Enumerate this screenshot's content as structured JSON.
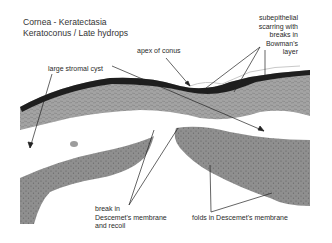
{
  "title": {
    "line1": "Cornea - Keratectasia",
    "line2": "Keratoconus / Late hydrops"
  },
  "labels": {
    "apex": "apex of conus",
    "cyst": "large stromal cyst",
    "scarring": [
      "subepithelial",
      "scarring with",
      "breaks in",
      "Bowman's",
      "layer"
    ],
    "break": [
      "break in",
      "Descemet's membrane",
      "and recoil"
    ],
    "folds": "folds in Descemet's membrane"
  },
  "colors": {
    "stroma": "#9a9a9a",
    "epithelium": "#1f1f1f",
    "background": "#ffffff",
    "text": "#2a2a2a"
  }
}
